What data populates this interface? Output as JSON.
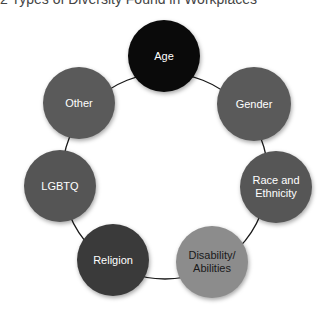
{
  "title": "2 Types of Diversity Found in Workplaces",
  "ring": {
    "cx": 165,
    "cy": 176,
    "r": 103,
    "stroke": "#1a1a1a",
    "stroke_width": 1.3
  },
  "nodes": [
    {
      "id": "age",
      "label": "Age",
      "cx": 164,
      "cy": 56,
      "r": 36,
      "fill": "#0a0a0a",
      "text_color": "#ffffff"
    },
    {
      "id": "gender",
      "label": "Gender",
      "cx": 254,
      "cy": 104,
      "r": 37,
      "fill": "#5a5a5a",
      "text_color": "#ffffff"
    },
    {
      "id": "race",
      "label": "Race and Ethnicity",
      "cx": 276,
      "cy": 187,
      "r": 36,
      "fill": "#565656",
      "text_color": "#ffffff"
    },
    {
      "id": "disability",
      "label": "Disability/ Abilities",
      "cx": 212,
      "cy": 262,
      "r": 36,
      "fill": "#8c8c8c",
      "text_color": "#1a1a1a"
    },
    {
      "id": "religion",
      "label": "Religion",
      "cx": 113,
      "cy": 260,
      "r": 36,
      "fill": "#3a3a3a",
      "text_color": "#ffffff"
    },
    {
      "id": "lgbtq",
      "label": "LGBTQ",
      "cx": 60,
      "cy": 186,
      "r": 36,
      "fill": "#555555",
      "text_color": "#ffffff"
    },
    {
      "id": "other",
      "label": "Other",
      "cx": 79,
      "cy": 103,
      "r": 36,
      "fill": "#5a5a5a",
      "text_color": "#ffffff"
    }
  ]
}
